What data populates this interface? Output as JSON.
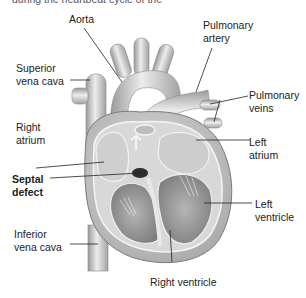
{
  "caption": "during the heartbeat cycle of the",
  "labels": {
    "aorta": "Aorta",
    "pulmonary_artery_1": "Pulmonary",
    "pulmonary_artery_2": "artery",
    "superior_vena_cava_1": "Superior",
    "superior_vena_cava_2": "vena cava",
    "pulmonary_veins_1": "Pulmonary",
    "pulmonary_veins_2": "veins",
    "right_atrium_1": "Right",
    "right_atrium_2": "atrium",
    "left_atrium_1": "Left",
    "left_atrium_2": "atrium",
    "septal_defect_1": "Septal",
    "septal_defect_2": "defect",
    "left_ventricle_1": "Left",
    "left_ventricle_2": "ventricle",
    "inferior_vena_cava_1": "Inferior",
    "inferior_vena_cava_2": "vena cava",
    "right_ventricle": "Right ventricle"
  },
  "colors": {
    "tissue_light": "#e4e4e4",
    "tissue_mid": "#c4c4c4",
    "tissue_dark": "#8e8e8e",
    "line": "#222222"
  }
}
